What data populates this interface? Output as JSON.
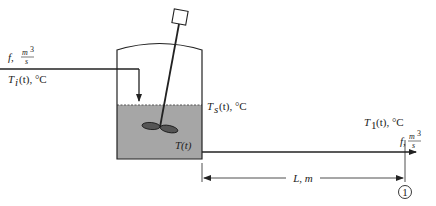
{
  "diagram": {
    "type": "stirred-tank-with-outlet-pipe",
    "colors": {
      "liquid": "#a6a6a6",
      "line": "#222222",
      "background": "#ffffff"
    },
    "inlet": {
      "flow_label": "f,",
      "flow_unit_num": "m",
      "flow_unit_exp": "3",
      "flow_unit_den": "s",
      "temp_label": "T",
      "temp_sub": "i",
      "temp_rest": "(t), °C"
    },
    "tank": {
      "surface_temp_label": "T",
      "surface_temp_sub": "s",
      "surface_temp_rest": "(t), °C",
      "liquid_temp_label": "T(t)"
    },
    "outlet": {
      "temp_label": "T",
      "temp_sub": "1",
      "temp_rest": "(t), °C",
      "flow_label": "f,",
      "flow_unit_num": "m",
      "flow_unit_exp": "3",
      "flow_unit_den": "s"
    },
    "dimension": {
      "label": "L, m"
    },
    "point_marker": {
      "label": "1"
    }
  }
}
